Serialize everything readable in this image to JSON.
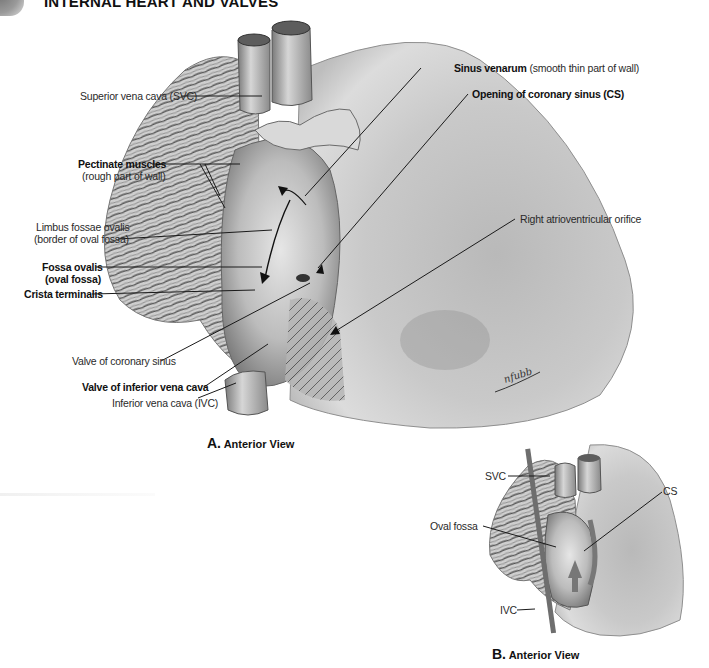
{
  "header": {
    "title": "INTERNAL HEART AND VALVES"
  },
  "figure_a": {
    "caption_letter": "A.",
    "caption_text": "Anterior View",
    "labels": {
      "svc": "Superior vena cava (SVC)",
      "pectinate_bold": "Pectinate muscles",
      "pectinate_sub": "(rough part of wall)",
      "limbus_1": "Limbus fossae ovalis",
      "limbus_2": "(border of oval fossa)",
      "fossa_bold_1": "Fossa ovalis",
      "fossa_bold_2": "(oval fossa)",
      "crista": "Crista terminalis",
      "valve_cs": "Valve of coronary sinus",
      "valve_ivc": "Valve of inferior vena cava",
      "ivc": "Inferior vena cava (IVC)",
      "sinus_bold": "Sinus venarum",
      "sinus_sub": "(smooth thin part of wall)",
      "opening_cs": "Opening of coronary sinus (CS)",
      "right_av": "Right atrioventricular orifice"
    }
  },
  "figure_b": {
    "caption_letter": "B.",
    "caption_text": "Anterior View",
    "labels": {
      "svc": "SVC",
      "cs": "CS",
      "oval_fossa": "Oval fossa",
      "ivc": "IVC"
    }
  },
  "colors": {
    "leader_line": "#1a1a1a",
    "tissue_light": "#d8d8d8",
    "tissue_mid": "#a8a8a8",
    "tissue_dark": "#5a5a5a"
  }
}
